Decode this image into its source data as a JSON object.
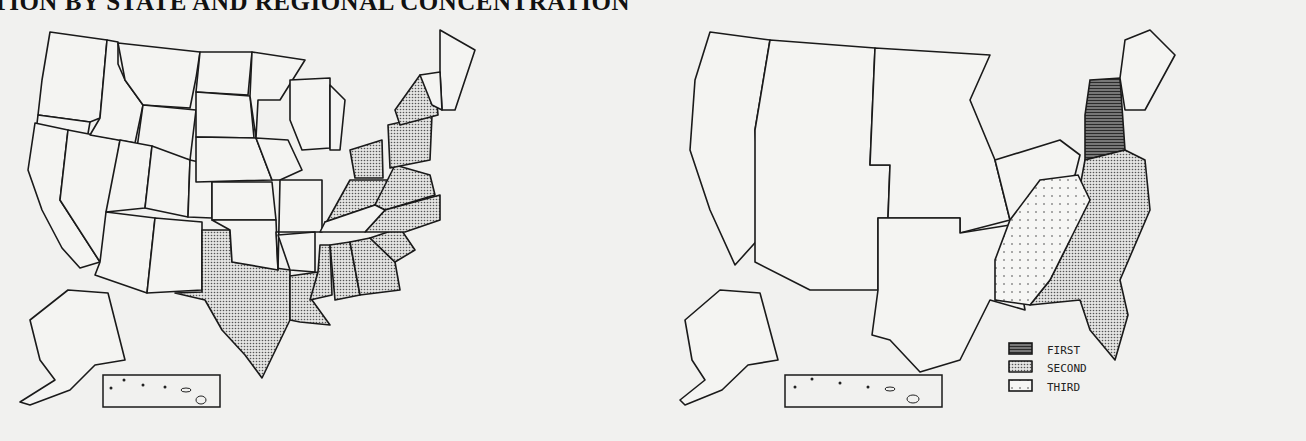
{
  "document": {
    "title": "TION BY STATE AND REGIONAL CONCENTRATION"
  },
  "maps": [
    {
      "id": "state-map",
      "description": "US states; shaded states indicate concentration",
      "shaded_states": [
        "NY",
        "PA",
        "NJ",
        "OH",
        "KY",
        "VA",
        "NC",
        "SC",
        "GA",
        "AL",
        "MS",
        "LA",
        "TX"
      ],
      "inset": "Hawaii"
    },
    {
      "id": "regional-map",
      "description": "US regions ranked by concentration",
      "legend": [
        {
          "label": "FIRST",
          "pattern": "dense"
        },
        {
          "label": "SECOND",
          "pattern": "medium"
        },
        {
          "label": "THIRD",
          "pattern": "sparse"
        }
      ],
      "regions": {
        "first": "Middle Atlantic (NY, PA, NJ)",
        "second": "South Atlantic",
        "third": "East South Central"
      },
      "inset": "Hawaii"
    }
  ],
  "colors": {
    "background": "#f1f1ef",
    "line": "#1a1a1a"
  }
}
